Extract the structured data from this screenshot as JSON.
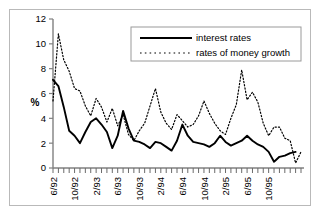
{
  "chart_data": {
    "type": "line",
    "title": "",
    "xlabel": "",
    "ylabel": "%",
    "ylim": [
      0,
      12
    ],
    "yticks": [
      0,
      2,
      4,
      6,
      8,
      10,
      12
    ],
    "grid": false,
    "legend_position": "top-right",
    "x_tick_interval_months": 4,
    "x_minor_ticks": "monthly",
    "x": [
      "6/92",
      "7/92",
      "8/92",
      "9/92",
      "10/92",
      "11/92",
      "12/92",
      "1/93",
      "2/93",
      "3/93",
      "4/93",
      "5/93",
      "6/93",
      "7/93",
      "8/93",
      "9/93",
      "10/93",
      "11/93",
      "12/93",
      "1/94",
      "2/94",
      "3/94",
      "4/94",
      "5/94",
      "6/94",
      "7/94",
      "8/94",
      "9/94",
      "10/94",
      "11/94",
      "12/94",
      "1/95",
      "2/95",
      "3/95",
      "4/95",
      "5/95",
      "6/95",
      "7/95",
      "8/95",
      "9/95",
      "10/95",
      "11/95"
    ],
    "xtick_labels": [
      "6/92",
      "10/92",
      "2/93",
      "6/93",
      "10/93",
      "2/94",
      "6/94",
      "10/94",
      "2/95",
      "6/95",
      "10/95"
    ],
    "series": [
      {
        "name": "interest rates",
        "style": "solid",
        "color": "#000000",
        "values": [
          7.1,
          6.6,
          4.9,
          3.0,
          2.6,
          2.0,
          2.9,
          3.7,
          4.0,
          3.5,
          2.9,
          1.6,
          2.6,
          4.6,
          3.2,
          2.2,
          2.1,
          1.9,
          1.6,
          2.1,
          2.0,
          1.7,
          1.4,
          2.2,
          3.5,
          2.6,
          2.1,
          2.0,
          1.9,
          1.7,
          2.0,
          2.6,
          2.1,
          1.8,
          2.0,
          2.2,
          2.6,
          2.2,
          1.9,
          1.7,
          1.3,
          0.5
        ]
      },
      {
        "name": "rates of money growth",
        "style": "dotted",
        "color": "#000000",
        "values": [
          5.4,
          10.8,
          8.7,
          7.8,
          6.4,
          6.2,
          5.0,
          4.2,
          5.6,
          4.9,
          3.7,
          4.8,
          3.4,
          4.3,
          2.7,
          2.2,
          3.0,
          3.6,
          5.0,
          6.4,
          4.5,
          3.6,
          3.1,
          4.3,
          3.8,
          3.3,
          3.5,
          4.2,
          5.4,
          4.4,
          3.6,
          3.0,
          2.7,
          4.0,
          5.1,
          7.9,
          5.5,
          6.1,
          5.3,
          3.6,
          2.6,
          3.3
        ]
      }
    ],
    "interest_rates_tail": [
      0.5,
      0.9,
      1.0,
      1.2,
      1.3
    ],
    "money_growth_tail": [
      4.0,
      3.3,
      2.4,
      2.2,
      0.4,
      1.3
    ]
  },
  "legend": {
    "items": [
      {
        "label": "interest rates",
        "style": "solid"
      },
      {
        "label": "rates of money growth",
        "style": "dotted"
      }
    ]
  },
  "axes": {
    "y_label": "%",
    "y_ticks": [
      "0",
      "2",
      "4",
      "6",
      "8",
      "10",
      "12"
    ],
    "x_ticks": [
      "6/92",
      "10/92",
      "2/93",
      "6/93",
      "10/93",
      "2/94",
      "6/94",
      "10/94",
      "2/95",
      "6/95",
      "10/95"
    ]
  }
}
